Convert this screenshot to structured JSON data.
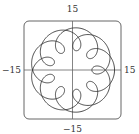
{
  "chart_data": {
    "type": "line",
    "subtype": "parametric-curve",
    "title": "",
    "xlabel": "",
    "ylabel": "",
    "xlim": [
      -15,
      15
    ],
    "ylim": [
      -15,
      15
    ],
    "grid": false,
    "legend": null,
    "tick_labels": {
      "x_min": "−15",
      "x_max": "15",
      "y_min": "−15",
      "y_max": "15"
    },
    "curve": {
      "description": "Looped epitrochoid-like curve with 9 inward loops, traced twice around",
      "x_equation": "a·cos(t) − b·cos(k·t)",
      "y_equation": "a·sin(t) − b·sin(k·t)",
      "a": 9.5,
      "b": 3.5,
      "k": 5.5,
      "t_range": [
        0,
        12.566
      ],
      "samples": 1200,
      "loops": 9,
      "color": "#333333"
    },
    "frame": {
      "rounded": true,
      "color": "#555555"
    },
    "axes_color": "#666666"
  }
}
